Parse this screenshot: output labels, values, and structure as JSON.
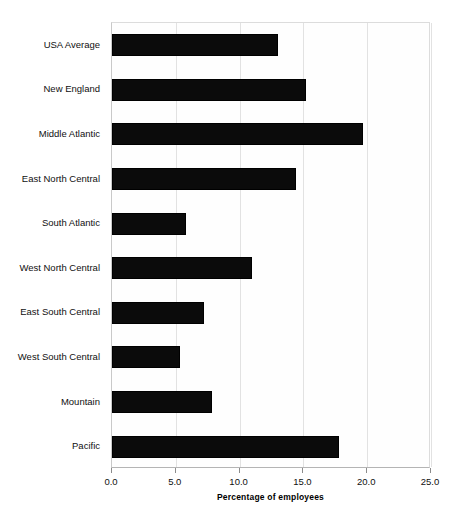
{
  "chart_data": {
    "type": "bar",
    "orientation": "horizontal",
    "title": "",
    "xlabel": "Percentage of employees",
    "ylabel": "",
    "xlim": [
      0.0,
      25.0
    ],
    "xticks": [
      "0.0",
      "5.0",
      "10.0",
      "15.0",
      "20.0",
      "25.0"
    ],
    "xtick_values": [
      0.0,
      5.0,
      10.0,
      15.0,
      20.0,
      25.0
    ],
    "grid": true,
    "legend": false,
    "bar_color": "#0b0b0b",
    "categories": [
      "USA Average",
      "New England",
      "Middle Atlantic",
      "East North Central",
      "South Atlantic",
      "West North Central",
      "East South Central",
      "West South Central",
      "Mountain",
      "Pacific"
    ],
    "values": [
      13.0,
      15.2,
      19.7,
      14.4,
      5.8,
      11.0,
      7.2,
      5.3,
      7.8,
      17.8
    ],
    "points": [
      {
        "category": "USA Average",
        "value": 13.0
      },
      {
        "category": "New England",
        "value": 15.2
      },
      {
        "category": "Middle Atlantic",
        "value": 19.7
      },
      {
        "category": "East North Central",
        "value": 14.4
      },
      {
        "category": "South Atlantic",
        "value": 5.8
      },
      {
        "category": "West North Central",
        "value": 11.0
      },
      {
        "category": "East South Central",
        "value": 7.2
      },
      {
        "category": "West South Central",
        "value": 5.3
      },
      {
        "category": "Mountain",
        "value": 7.8
      },
      {
        "category": "Pacific",
        "value": 17.8
      }
    ]
  }
}
